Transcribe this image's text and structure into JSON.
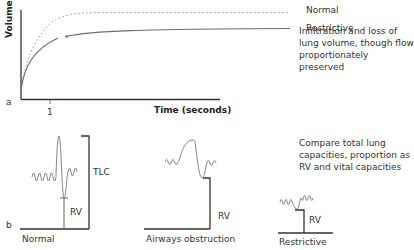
{
  "panel_a": {
    "letter": "a",
    "y_axis_label": "Volume",
    "x_axis_label": "Time (seconds)",
    "x_tick": "1",
    "legend": [
      {
        "label": "Normal",
        "style": "dotted",
        "color": "#9a9a9a"
      },
      {
        "label": "Restrictive",
        "style": "solid",
        "color": "#6e6e6e"
      }
    ],
    "annotation": "Infiltration and loss of lung volume, though flow proportionately preserved"
  },
  "panel_b": {
    "letter": "b",
    "diagrams": [
      {
        "title": "Normal",
        "labels": [
          "TLC",
          "RV"
        ]
      },
      {
        "title": "Airways obstruction",
        "labels": [
          "RV"
        ]
      },
      {
        "title": "Restrictive",
        "labels": [
          "RV"
        ]
      }
    ],
    "annotation": "Compare total lung capacities, proportion as RV and vital capacities"
  },
  "colors": {
    "axis": "#333333",
    "curve": "#6e6e6e",
    "dotted": "#9a9a9a",
    "spirogram": "#777777"
  }
}
